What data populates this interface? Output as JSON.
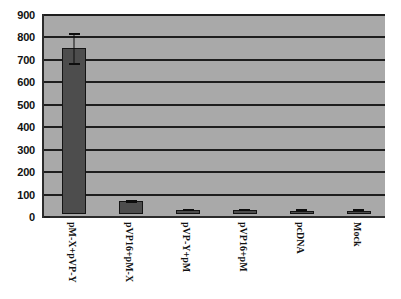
{
  "chart_data": {
    "type": "bar",
    "title": "",
    "subtitle": "",
    "xlabel": "",
    "ylabel": "",
    "ylim": [
      0,
      900
    ],
    "ytick_step": 100,
    "yticks": [
      900,
      800,
      700,
      600,
      500,
      400,
      300,
      200,
      100,
      0
    ],
    "grid": true,
    "legend": false,
    "legend_position": "none",
    "categories": [
      "pM-X+pVP-Y",
      "pVP16+pM-X",
      "pVP-Y+pM",
      "pVP16+pM",
      "pcDNA",
      "Mock"
    ],
    "values": [
      740,
      57,
      18,
      17,
      15,
      15
    ],
    "errors": [
      70,
      6,
      3,
      3,
      3,
      2
    ],
    "error_bars": [
      {
        "category": "pM-X+pVP-Y",
        "value": 740,
        "low": 665,
        "high": 805
      },
      {
        "category": "pVP16+pM-X",
        "value": 57,
        "low": 51,
        "high": 63
      },
      {
        "category": "pVP-Y+pM",
        "value": 18,
        "low": 15,
        "high": 21
      },
      {
        "category": "pVP16+pM",
        "value": 17,
        "low": 14,
        "high": 20
      },
      {
        "category": "pcDNA",
        "value": 15,
        "low": 12,
        "high": 18
      },
      {
        "category": "Mock",
        "value": 15,
        "low": 13,
        "high": 17
      }
    ],
    "colors": {
      "bar_fill": "#4d4d4d",
      "bar_outline": "#141414",
      "plot_background": "#a9a9a9",
      "gridline": "#1e1e1e",
      "axis": "#2b2b2b",
      "page_background": "#ffffff",
      "tick_label": "#111111",
      "category_label": "#121212"
    }
  }
}
